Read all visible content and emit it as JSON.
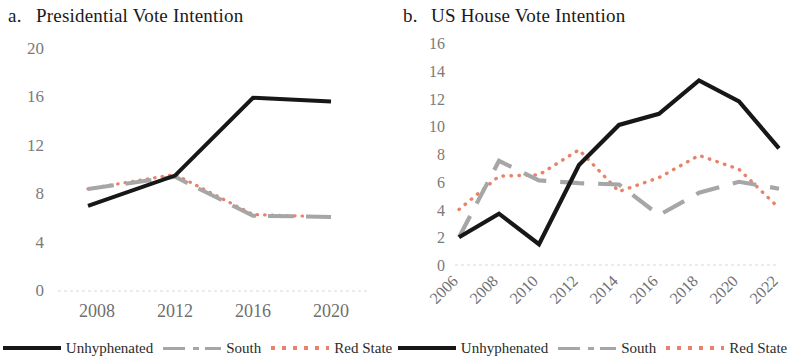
{
  "figure": {
    "panels": [
      {
        "id": "a",
        "tag": "a.",
        "title": "Presidential Vote Intention"
      },
      {
        "id": "b",
        "tag": "b.",
        "title": "US House Vote Intention"
      }
    ],
    "legend": {
      "unhyphenated": "Unhyphenated",
      "south": "South",
      "red_state": "Red State"
    },
    "colors": {
      "unhyphenated": "#171717",
      "south": "#a6a6a6",
      "red_state": "#e8836a",
      "axis": "#d9d9d9",
      "tick_text": "#7a7a7a"
    }
  },
  "chart_data": [
    {
      "type": "line",
      "title": "Presidential Vote Intention",
      "panel_tag": "a.",
      "xlabel": "",
      "ylabel": "",
      "x": [
        2008,
        2012,
        2016,
        2020
      ],
      "categories": [
        "2008",
        "2012",
        "2016",
        "2020"
      ],
      "xtick_labels": [
        "2008",
        "2012",
        "2016",
        "2020"
      ],
      "ytick_labels": [
        "0",
        "4",
        "8",
        "12",
        "16",
        "20"
      ],
      "yticks": [
        0,
        4,
        8,
        12,
        16,
        20
      ],
      "ylim": [
        0,
        20
      ],
      "xlim": [
        2008,
        2020
      ],
      "grid": false,
      "legend_position": "bottom",
      "series": [
        {
          "name": "Unhyphenated",
          "style": "solid",
          "color": "#171717",
          "values": [
            7.0,
            9.5,
            15.9,
            15.6
          ]
        },
        {
          "name": "South",
          "style": "dashed",
          "color": "#a6a6a6",
          "values": [
            8.4,
            9.4,
            6.2,
            6.1
          ]
        },
        {
          "name": "Red State",
          "style": "dotted",
          "color": "#e8836a",
          "values": [
            8.4,
            9.6,
            6.3,
            6.1
          ]
        }
      ]
    },
    {
      "type": "line",
      "title": "US House Vote Intention",
      "panel_tag": "b.",
      "xlabel": "",
      "ylabel": "",
      "x": [
        2006,
        2008,
        2010,
        2012,
        2014,
        2016,
        2018,
        2020,
        2022
      ],
      "categories": [
        "2006",
        "2008",
        "2010",
        "2012",
        "2014",
        "2016",
        "2018",
        "2020",
        "2022"
      ],
      "xtick_labels": [
        "2006",
        "2008",
        "2010",
        "2012",
        "2014",
        "2016",
        "2018",
        "2020",
        "2022"
      ],
      "ytick_labels": [
        "0",
        "2",
        "4",
        "6",
        "8",
        "10",
        "12",
        "14",
        "16"
      ],
      "yticks": [
        0,
        2,
        4,
        6,
        8,
        10,
        12,
        14,
        16
      ],
      "ylim": [
        0,
        16
      ],
      "xlim": [
        2006,
        2022
      ],
      "grid": false,
      "legend_position": "bottom",
      "series": [
        {
          "name": "Unhyphenated",
          "style": "solid",
          "color": "#171717",
          "values": [
            2.0,
            3.7,
            1.5,
            7.2,
            10.1,
            10.9,
            13.3,
            11.8,
            8.4
          ]
        },
        {
          "name": "South",
          "style": "dashed",
          "color": "#a6a6a6",
          "values": [
            2.0,
            7.5,
            6.1,
            5.9,
            5.8,
            3.6,
            5.2,
            6.0,
            5.5
          ]
        },
        {
          "name": "Red State",
          "style": "dotted",
          "color": "#e8836a",
          "values": [
            4.0,
            6.4,
            6.5,
            8.3,
            5.3,
            6.3,
            7.9,
            6.9,
            4.1
          ]
        }
      ]
    }
  ]
}
